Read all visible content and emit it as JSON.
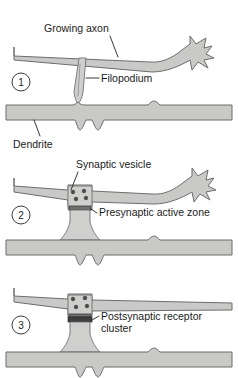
{
  "figure": {
    "background_color": "#ffffff",
    "structure_fill": "#c9c9c7",
    "structure_stroke": "#6d6d6d",
    "vesicle_color": "#4a4a4a",
    "active_zone_color": "#6f6f6f",
    "receptor_cluster_color": "#3f3f3f",
    "text_color": "#1b1b1b"
  },
  "panels": [
    {
      "number": "1",
      "labels": [
        {
          "id": "growing-axon",
          "text": "Growing axon"
        },
        {
          "id": "filopodium",
          "text": "Filopodium"
        },
        {
          "id": "dendrite",
          "text": "Dendrite"
        }
      ]
    },
    {
      "number": "2",
      "labels": [
        {
          "id": "synaptic-vesicle",
          "text": "Synaptic vesicle"
        },
        {
          "id": "presynaptic-active-zone",
          "text": "Presynaptic active zone"
        }
      ]
    },
    {
      "number": "3",
      "labels": [
        {
          "id": "postsynaptic-receptor-cluster-line1",
          "text": "Postsynaptic receptor"
        },
        {
          "id": "postsynaptic-receptor-cluster-line2",
          "text": "cluster"
        }
      ]
    }
  ],
  "text": {
    "growing_axon": "Growing axon",
    "filopodium": "Filopodium",
    "dendrite": "Dendrite",
    "synaptic_vesicle": "Synaptic vesicle",
    "presynaptic_active_zone": "Presynaptic active zone",
    "postsynaptic_receptor_cluster_l1": "Postsynaptic receptor",
    "postsynaptic_receptor_cluster_l2": "cluster",
    "panel_one": "1",
    "panel_two": "2",
    "panel_three": "3"
  }
}
